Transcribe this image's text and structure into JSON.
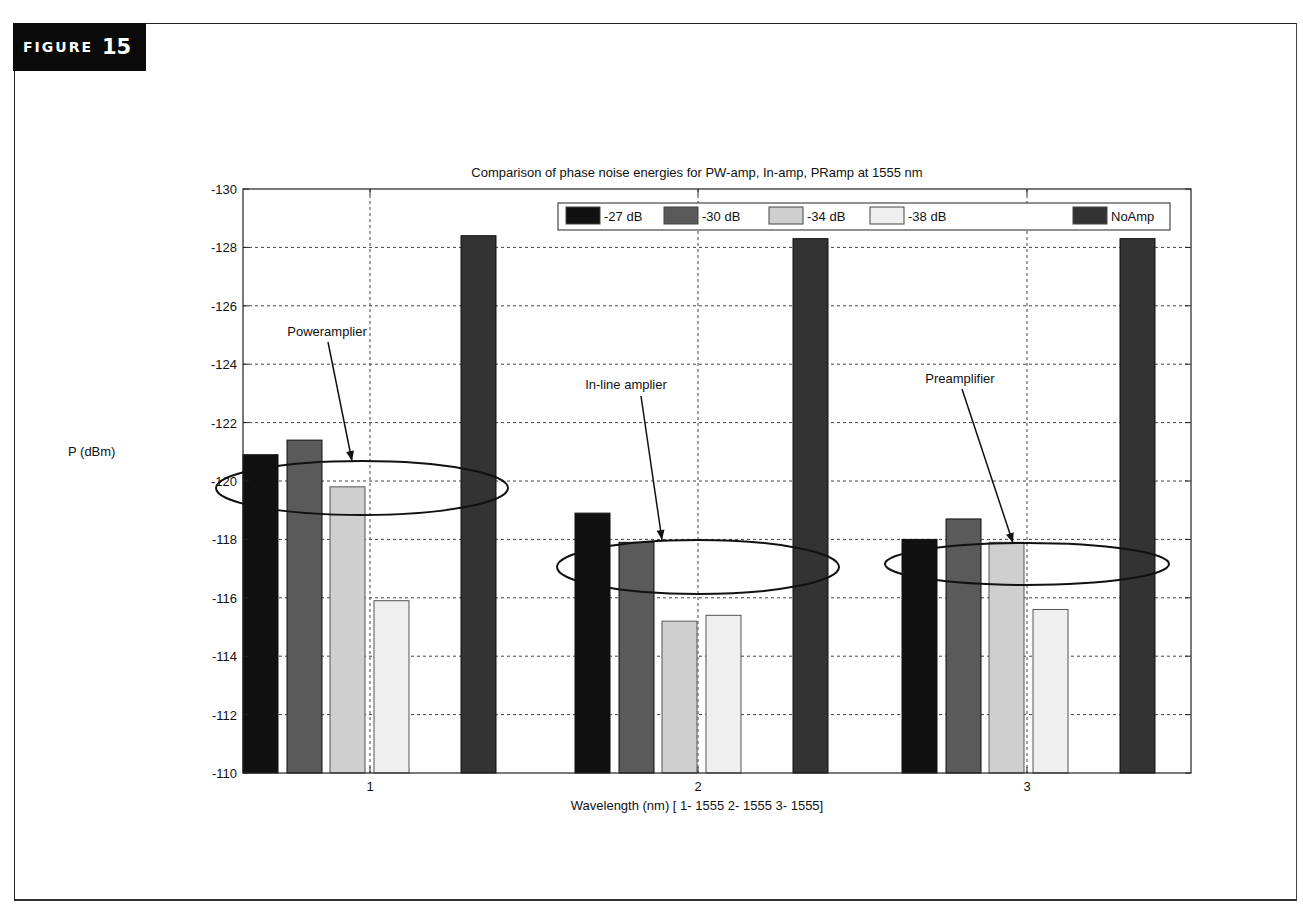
{
  "figure": {
    "word": "FIGURE",
    "number": "15"
  },
  "chart_data": {
    "type": "bar",
    "title": "Comparison of phase noise energies for PW-amp, In-amp, PRamp at 1555 nm",
    "xlabel": "Wavelength (nm) [ 1-  1555 2- 1555 3- 1555]",
    "ylabel": "P (dBm)",
    "categories": [
      "1",
      "2",
      "3"
    ],
    "ylim": [
      -110,
      -130
    ],
    "yaxis_reversed": true,
    "yticks": [
      "-130",
      "-128",
      "-126",
      "-124",
      "-122",
      "-120",
      "-118",
      "-116",
      "-114",
      "-112",
      "-110"
    ],
    "grid": true,
    "legend_position": "top-inside",
    "series": [
      {
        "name": "-27 dB",
        "color": "#111111",
        "values": [
          -120.9,
          -118.9,
          -118.0
        ]
      },
      {
        "name": "-30 dB",
        "color": "#5a5a5a",
        "values": [
          -121.4,
          -117.9,
          -118.7
        ]
      },
      {
        "name": "-34 dB",
        "color": "#cfcfcf",
        "values": [
          -119.8,
          -115.2,
          -117.9
        ]
      },
      {
        "name": "-38 dB",
        "color": "#efefef",
        "values": [
          -115.9,
          -115.4,
          -115.6
        ]
      },
      {
        "name": "NoAmp",
        "color": "#333333",
        "values": [
          -128.4,
          -128.3,
          -128.3
        ]
      }
    ],
    "annotations": [
      {
        "text": "Poweramplier",
        "group": 1
      },
      {
        "text": "In-line amplier",
        "group": 2
      },
      {
        "text": "Preamplifier",
        "group": 3
      }
    ]
  }
}
